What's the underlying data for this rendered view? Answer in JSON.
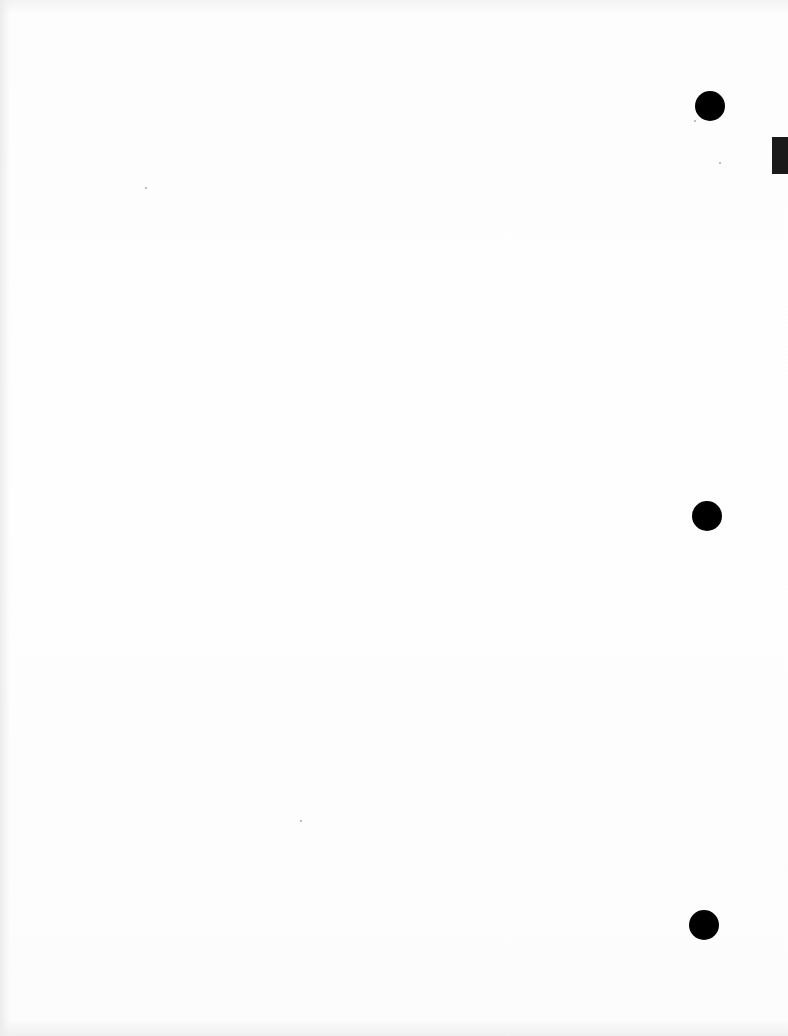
{
  "document": {
    "type": "scanned-blank-page",
    "text": "",
    "punch_holes": [
      {
        "cx": 710,
        "cy": 106,
        "r": 15
      },
      {
        "cx": 707,
        "cy": 516,
        "r": 15
      },
      {
        "cx": 704,
        "cy": 925,
        "r": 15
      }
    ],
    "edge_tab": {
      "x": 772,
      "y": 137,
      "w": 16,
      "h": 37
    },
    "colors": {
      "paper": "#fdfdfd",
      "hole": "#000000",
      "tab": "#1a1a1a"
    }
  }
}
